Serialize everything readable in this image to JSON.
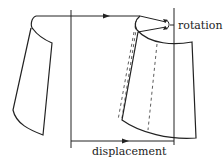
{
  "diagram": {
    "labels": {
      "rotation": "rotation",
      "displacement": "displacement"
    },
    "colors": {
      "stroke": "#222222",
      "background": "#ffffff"
    }
  }
}
